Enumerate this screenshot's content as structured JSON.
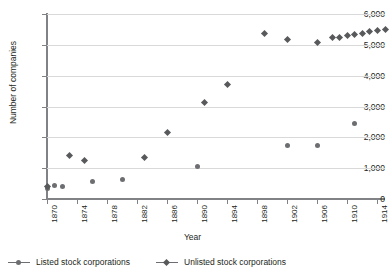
{
  "chart_data": {
    "type": "scatter",
    "title": "",
    "xlabel": "Year",
    "ylabel": "Number of companies",
    "xlim": [
      1870,
      1915
    ],
    "ylim": [
      0,
      6000
    ],
    "grid": true,
    "legend_position": "bottom-left",
    "x_ticks": [
      1870,
      1874,
      1878,
      1882,
      1886,
      1890,
      1894,
      1898,
      1902,
      1906,
      1910,
      1914
    ],
    "y_ticks": [
      0,
      1000,
      2000,
      3000,
      4000,
      5000,
      6000
    ],
    "y_tick_labels": [
      "0",
      "1,000",
      "2,000",
      "3,000",
      "4,000",
      "5,000",
      "6,000"
    ],
    "x_tick_labels": [
      "1870",
      "1874",
      "1878",
      "1882",
      "1886",
      "1890",
      "1894",
      "1898",
      "1902",
      "1906",
      "1910",
      "1914"
    ],
    "series": [
      {
        "name": "Listed stock corporations",
        "marker": "circle",
        "color": "#6d6e71",
        "points": [
          {
            "x": 1870,
            "y": 350
          },
          {
            "x": 1871,
            "y": 430
          },
          {
            "x": 1872,
            "y": 400
          },
          {
            "x": 1876,
            "y": 570
          },
          {
            "x": 1880,
            "y": 630
          },
          {
            "x": 1890,
            "y": 1040
          },
          {
            "x": 1902,
            "y": 1750
          },
          {
            "x": 1906,
            "y": 1740
          },
          {
            "x": 1911,
            "y": 2450
          }
        ]
      },
      {
        "name": "Unlisted stock corporations",
        "marker": "diamond",
        "color": "#58595b",
        "points": [
          {
            "x": 1870,
            "y": 420
          },
          {
            "x": 1873,
            "y": 1420
          },
          {
            "x": 1875,
            "y": 1250
          },
          {
            "x": 1883,
            "y": 1340
          },
          {
            "x": 1886,
            "y": 2150
          },
          {
            "x": 1891,
            "y": 3120
          },
          {
            "x": 1894,
            "y": 3720
          },
          {
            "x": 1899,
            "y": 5380
          },
          {
            "x": 1902,
            "y": 5180
          },
          {
            "x": 1906,
            "y": 5060
          },
          {
            "x": 1908,
            "y": 5230
          },
          {
            "x": 1909,
            "y": 5250
          },
          {
            "x": 1910,
            "y": 5290
          },
          {
            "x": 1911,
            "y": 5330
          },
          {
            "x": 1912,
            "y": 5380
          },
          {
            "x": 1913,
            "y": 5430
          },
          {
            "x": 1914,
            "y": 5480
          },
          {
            "x": 1915,
            "y": 5510
          }
        ]
      }
    ]
  },
  "legend": {
    "entries": [
      {
        "label": "Listed stock corporations",
        "marker": "circle"
      },
      {
        "label": "Unlisted stock corporations",
        "marker": "diamond"
      }
    ]
  }
}
